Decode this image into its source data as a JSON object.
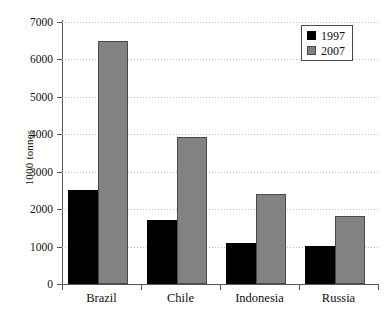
{
  "chart_data": {
    "type": "bar",
    "title": "",
    "subtitle": "",
    "xlabel": "",
    "ylabel": "1000 tonnes",
    "categories": [
      "Brazil",
      "Chile",
      "Indonesia",
      "Russia"
    ],
    "series": [
      {
        "name": "1997",
        "color": "#000000",
        "values": [
          2500,
          1700,
          1100,
          1010
        ]
      },
      {
        "name": "2007",
        "color": "#828282",
        "values": [
          6500,
          3930,
          2400,
          1810
        ]
      }
    ],
    "ylim": [
      0,
      7000
    ],
    "yticks": [
      0,
      1000,
      2000,
      3000,
      4000,
      5000,
      6000,
      7000
    ],
    "ytick_labels": [
      "0",
      "1000",
      "2000",
      "3000",
      "4000",
      "5000",
      "6000",
      "7000"
    ],
    "grid": true,
    "grid_style": "dotted",
    "grid_color": "#b9b9b9",
    "legend_position": "top-right",
    "legend_entries": [
      "1997",
      "2007"
    ],
    "axis_color": "#555555",
    "background": "#ffffff"
  }
}
